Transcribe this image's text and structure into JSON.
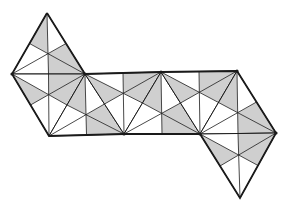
{
  "diagram": {
    "fill_color": "#cfcfcf",
    "stroke_color": "#1a1a1a",
    "background": "#ffffff",
    "vertices": {
      "A": [
        47,
        13
      ],
      "L": [
        12,
        74
      ],
      "T1": [
        85,
        74
      ],
      "T2": [
        161,
        72
      ],
      "T3": [
        237,
        71
      ],
      "B0": [
        49,
        136
      ],
      "B1": [
        124,
        134
      ],
      "B2": [
        200,
        134
      ],
      "R": [
        276,
        133
      ],
      "D": [
        240,
        198
      ]
    },
    "triangles": [
      {
        "name": "top-left",
        "pts": [
          "A",
          "L",
          "T1"
        ]
      },
      {
        "name": "left-lower",
        "pts": [
          "L",
          "T1",
          "B0"
        ]
      },
      {
        "name": "mid-1",
        "pts": [
          "T1",
          "B0",
          "B1"
        ]
      },
      {
        "name": "mid-2",
        "pts": [
          "T1",
          "T2",
          "B1"
        ]
      },
      {
        "name": "mid-3",
        "pts": [
          "T2",
          "B1",
          "B2"
        ]
      },
      {
        "name": "mid-4",
        "pts": [
          "T2",
          "T3",
          "B2"
        ]
      },
      {
        "name": "right-upper",
        "pts": [
          "T3",
          "B2",
          "R"
        ]
      },
      {
        "name": "bottom-right",
        "pts": [
          "B2",
          "R",
          "D"
        ]
      }
    ],
    "faint_text": [
      "",
      ""
    ]
  }
}
